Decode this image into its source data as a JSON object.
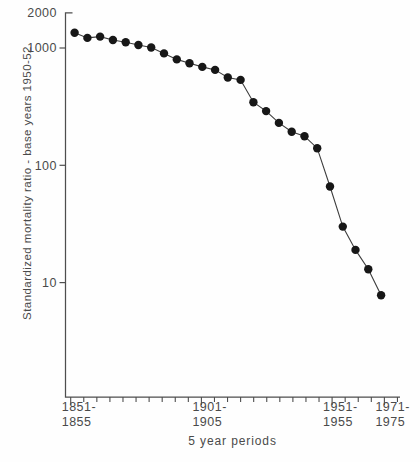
{
  "figure": {
    "background": "#fefefe",
    "axis_color": "#4e4e4e",
    "point_color": "#171717",
    "line_color": "#3d3d3d",
    "text_color": "#4a4a4a"
  },
  "chart_data": {
    "type": "line",
    "title": "",
    "ylabel": "Standardized mortality ratio - base years 1950-52",
    "xlabel": "5 year periods",
    "y_scale": "log",
    "ylim": [
      1,
      2000
    ],
    "grid": "off",
    "legend": "none",
    "marker": "filled-circle",
    "y_ticks": [
      {
        "label": "2000",
        "value": 2000
      },
      {
        "label": "1000",
        "value": 1000
      },
      {
        "label": "100",
        "value": 100
      },
      {
        "label": "10",
        "value": 10
      }
    ],
    "x_tick_labels": [
      {
        "line1": "1851-",
        "line2": "1855",
        "period_index": 0
      },
      {
        "line1": "1901-",
        "line2": "1905",
        "period_index": 10
      },
      {
        "line1": "1951-",
        "line2": "1955",
        "period_index": 20
      },
      {
        "line1": "1971-",
        "line2": "1975",
        "period_index": 24
      }
    ],
    "categories": [
      "1851-55",
      "1856-60",
      "1861-65",
      "1866-70",
      "1871-75",
      "1876-80",
      "1881-85",
      "1886-90",
      "1891-95",
      "1896-1900",
      "1901-05",
      "1906-10",
      "1911-15",
      "1916-20",
      "1921-25",
      "1926-30",
      "1931-35",
      "1936-40",
      "1941-45",
      "1946-50",
      "1951-55",
      "1956-60",
      "1961-65",
      "1966-70",
      "1971-75"
    ],
    "values": [
      1350,
      1220,
      1250,
      1170,
      1120,
      1060,
      1010,
      900,
      800,
      740,
      690,
      650,
      560,
      535,
      345,
      290,
      230,
      193,
      177,
      140,
      66,
      30,
      19,
      13,
      7.8
    ]
  }
}
